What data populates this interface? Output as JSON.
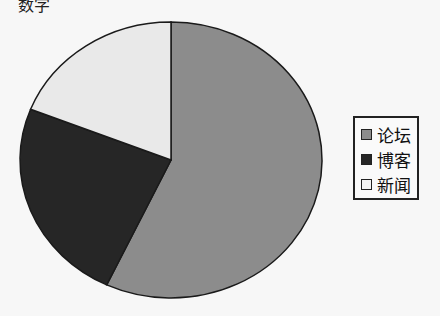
{
  "top_fragment": "数字",
  "chart_data": {
    "type": "pie",
    "title": "",
    "categories": [
      "论坛",
      "博客",
      "新闻"
    ],
    "values": [
      57,
      24,
      19
    ],
    "colors": [
      "#8c8c8c",
      "#262626",
      "#e9e9e9"
    ],
    "start_angle_deg": 0,
    "direction": "clockwise",
    "legend_position": "right"
  },
  "legend": {
    "items": [
      {
        "label": "论坛",
        "color": "#8c8c8c"
      },
      {
        "label": "博客",
        "color": "#262626"
      },
      {
        "label": "新闻",
        "color": "#f4f4f4"
      }
    ]
  }
}
